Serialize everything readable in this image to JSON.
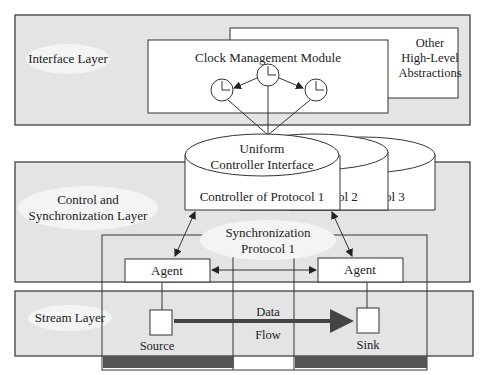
{
  "layers": {
    "interface": {
      "label": "Interface Layer"
    },
    "control": {
      "label_line1": "Control and",
      "label_line2": "Synchronization Layer"
    },
    "stream": {
      "label": "Stream Layer"
    }
  },
  "modules": {
    "clock_management": {
      "label": "Clock Management Module"
    },
    "other_abstractions": {
      "line1": "Other",
      "line2": "High-Level",
      "line3": "Abstractions"
    }
  },
  "controllers": {
    "interface_line1": "Uniform",
    "interface_line2": "Controller Interface",
    "c1": "Controller of Protocol 1",
    "c2": "col 2",
    "c3": "col 3"
  },
  "sync_protocol": {
    "line1": "Synchronization",
    "line2": "Protocol 1"
  },
  "agents": {
    "left": "Agent",
    "right": "Agent"
  },
  "stream": {
    "source": "Source",
    "sink": "Sink",
    "data": "Data",
    "flow": "Flow"
  },
  "colors": {
    "layer_fill": "#e4e4e4",
    "box_fill": "#ffffff",
    "stroke": "#333333",
    "dark_bar": "#555555"
  }
}
